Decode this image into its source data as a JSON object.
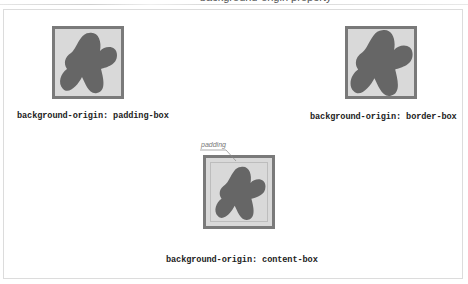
{
  "figure": {
    "top_caption_clipped": "background-origin property",
    "colors": {
      "border": "#7a7a7a",
      "background_fill": "#d9d9d9",
      "blob": "#666666",
      "frame": "#dcdcdc",
      "callout": "#777777"
    },
    "examples": [
      {
        "id": "padding-box",
        "label": "background-origin: padding-box"
      },
      {
        "id": "border-box",
        "label": "background-origin: border-box"
      },
      {
        "id": "content-box",
        "label": "background-origin: content-box"
      }
    ],
    "callout": {
      "text": "padding"
    }
  }
}
